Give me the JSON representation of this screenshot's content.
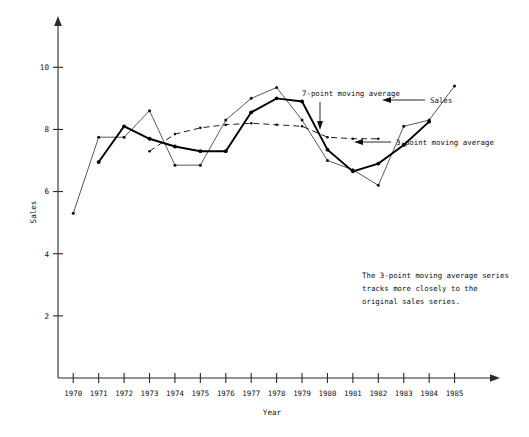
{
  "chart_data": {
    "type": "line",
    "title": "",
    "xlabel": "Year",
    "ylabel": "Sales",
    "xlim": [
      1969.4,
      1986.0
    ],
    "ylim": [
      0,
      11.2
    ],
    "grid": false,
    "legend_position": "inline-annotations",
    "x": [
      1970,
      1971,
      1972,
      1973,
      1974,
      1975,
      1976,
      1977,
      1978,
      1979,
      1980,
      1981,
      1982,
      1983,
      1984,
      1985
    ],
    "xtick_labels": [
      "1970",
      "1971",
      "1972",
      "1973",
      "1974",
      "1975",
      "1976",
      "1977",
      "1978",
      "1979",
      "1980",
      "1981",
      "1982",
      "1983",
      "1984",
      "1985"
    ],
    "ytick_labels": [
      "2",
      "4",
      "6",
      "8",
      "10"
    ],
    "yticks": [
      2,
      4,
      6,
      8,
      10
    ],
    "series": [
      {
        "name": "Sales",
        "style": "thin-solid",
        "x": [
          1970,
          1971,
          1972,
          1973,
          1974,
          1975,
          1976,
          1977,
          1978,
          1979,
          1980,
          1981,
          1982,
          1983,
          1984,
          1985
        ],
        "values": [
          5.3,
          7.75,
          7.75,
          8.6,
          6.85,
          6.85,
          8.3,
          9.0,
          9.35,
          8.3,
          7.0,
          6.7,
          6.2,
          8.1,
          8.3,
          9.4
        ]
      },
      {
        "name": "3-point moving average",
        "style": "thick-solid",
        "x": [
          1971,
          1972,
          1973,
          1974,
          1975,
          1976,
          1977,
          1978,
          1979,
          1980,
          1981,
          1982,
          1983,
          1984
        ],
        "values": [
          6.95,
          8.1,
          7.7,
          7.45,
          7.3,
          7.3,
          8.55,
          9.0,
          8.9,
          7.35,
          6.65,
          6.9,
          7.5,
          8.25
        ]
      },
      {
        "name": "7-point moving average",
        "style": "dashed",
        "x": [
          1973,
          1974,
          1975,
          1976,
          1977,
          1978,
          1979,
          1980,
          1981,
          1982
        ],
        "values": [
          7.3,
          7.85,
          8.05,
          8.15,
          8.2,
          8.15,
          8.1,
          7.75,
          7.7,
          7.7
        ]
      }
    ],
    "annotations": [
      {
        "name": "note",
        "text_lines": [
          "The 3-point moving average series",
          "tracks more closely to the",
          "original sales series."
        ]
      },
      {
        "name": "label-ma7",
        "text": "7-point moving average"
      },
      {
        "name": "label-sales",
        "text": "Sales"
      },
      {
        "name": "label-ma3",
        "text": "3-point moving average"
      }
    ]
  },
  "axes": {
    "y_title": "Sales",
    "x_title": "Year"
  },
  "labels": {
    "ma7": "7-point moving average",
    "sales": "Sales",
    "ma3": "3-point moving average",
    "note_line1": "The 3-point moving average series",
    "note_line2": "tracks more closely to the",
    "note_line3": "original sales series."
  },
  "colors": {
    "ink": "#111111",
    "background": "#ffffff"
  }
}
